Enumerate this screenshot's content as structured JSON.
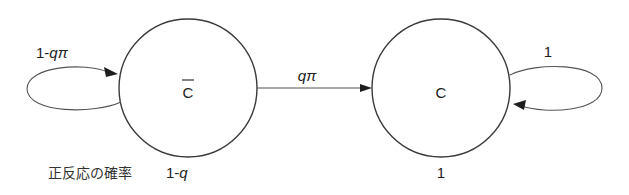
{
  "diagram": {
    "type": "state-transition",
    "nodes": [
      {
        "id": "c_bar",
        "label": "C",
        "overline": true,
        "below_label_prefix": "正反応の確率",
        "below_label_value": "1-q"
      },
      {
        "id": "c",
        "label": "C",
        "overline": false,
        "below_label_value": "1"
      }
    ],
    "edges": [
      {
        "from": "c_bar",
        "to": "c_bar",
        "label_prefix": "1-",
        "label_var": "qπ"
      },
      {
        "from": "c_bar",
        "to": "c",
        "label_var": "qπ"
      },
      {
        "from": "c",
        "to": "c",
        "label": "1"
      }
    ],
    "colors": {
      "stroke": "#3a3a3a",
      "text": "#222222",
      "background": "#ffffff"
    }
  }
}
